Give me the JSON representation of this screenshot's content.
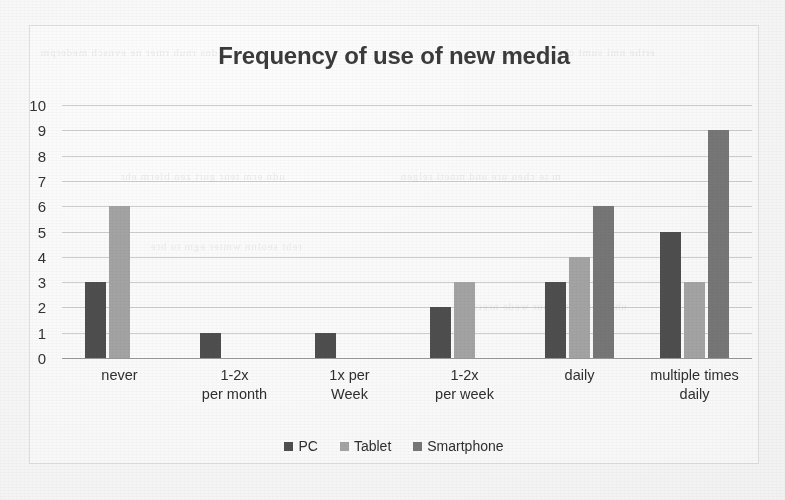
{
  "chart_data": {
    "type": "bar",
    "title": "Frequency of use of new media",
    "xlabel": "",
    "ylabel": "",
    "ylim": [
      0,
      10
    ],
    "yticks": [
      10,
      9,
      8,
      7,
      6,
      5,
      4,
      3,
      2,
      1,
      0
    ],
    "grid": true,
    "legend_position": "bottom",
    "categories": [
      "never",
      "1-2x per month",
      "1x per Week",
      "1-2x per week",
      "daily",
      "multiple times daily"
    ],
    "category_lines": [
      [
        "never",
        ""
      ],
      [
        "1-2x",
        "per month"
      ],
      [
        "1x per",
        "Week"
      ],
      [
        "1-2x",
        "per week"
      ],
      [
        "daily",
        ""
      ],
      [
        "multiple times",
        "daily"
      ]
    ],
    "series": [
      {
        "name": "PC",
        "color": "#4e4e4e",
        "values": [
          3,
          1,
          1,
          2,
          3,
          5
        ]
      },
      {
        "name": "Tablet",
        "color": "#a3a3a3",
        "values": [
          6,
          0,
          0,
          3,
          4,
          3
        ]
      },
      {
        "name": "Smartphone",
        "color": "#767676",
        "values": [
          0,
          0,
          0,
          0,
          6,
          9
        ]
      }
    ]
  },
  "legend": {
    "items": [
      {
        "label": "PC",
        "key": "pc"
      },
      {
        "label": "Tablet",
        "key": "tablet"
      },
      {
        "label": "Smartphone",
        "key": "smartphone"
      }
    ]
  },
  "scan_artifacts": {
    "bleed_lines": [
      "dns rnuh rmer ne evnsch mederpm",
      "erthe nmi sumt cha nesto reve",
      "udn erm tenr gurt zen blerm ehr",
      "m te chen ure und mneti relgen",
      "reht seolnn wmter egm tu bre",
      "uhr tsen miteh nur wede nrech"
    ]
  }
}
